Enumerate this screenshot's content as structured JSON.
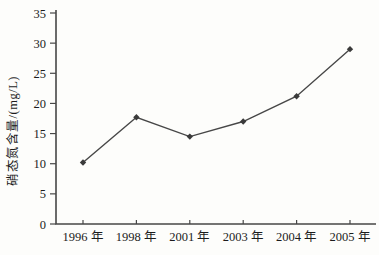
{
  "chart_data": {
    "type": "line",
    "categories": [
      "1996 年",
      "1998 年",
      "2001 年",
      "2003 年",
      "2004 年",
      "2005 年"
    ],
    "series": [
      {
        "name": "硝态氮含量",
        "values": [
          10.2,
          17.7,
          14.5,
          17.0,
          21.2,
          29.0
        ]
      }
    ],
    "title": "",
    "xlabel": "",
    "ylabel": "硝态氮含量/(mg/L)",
    "ylim": [
      0,
      35
    ],
    "yticks": [
      0,
      5,
      10,
      15,
      20,
      25,
      30,
      35
    ],
    "grid": false,
    "legend": false,
    "marker": "diamond",
    "colors": {
      "line": "#474747",
      "marker": "#3a3a3a",
      "axis": "#474747",
      "text": "#1c1c1c",
      "background": "#fdfdfb"
    }
  }
}
